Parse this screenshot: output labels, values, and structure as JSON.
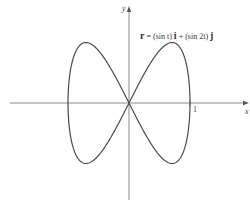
{
  "figure": {
    "equation": {
      "r": "r",
      "eq_part1": " = (sin t) ",
      "i": "i",
      "eq_part2": " + (sin 2t) ",
      "j": "j"
    },
    "axes": {
      "x_label": "x",
      "y_label": "y",
      "x_tick_label": "1"
    },
    "colors": {
      "curve": "#4a4a4a",
      "axis": "#8a8a8a"
    }
  },
  "chart_data": {
    "type": "line",
    "xlabel": "x",
    "ylabel": "y",
    "parametric": {
      "x": "sin t",
      "y": "sin 2t",
      "t_range": [
        0,
        6.2832
      ]
    },
    "xlim": [
      -2,
      2
    ],
    "ylim": [
      -1.7,
      1.7
    ],
    "x_ticks": [
      1
    ],
    "grid": false,
    "key_points": [
      {
        "x": 0,
        "y": 0
      },
      {
        "x": 0.707,
        "y": 1
      },
      {
        "x": 1,
        "y": 0
      },
      {
        "x": 0.707,
        "y": -1
      },
      {
        "x": -0.707,
        "y": 1
      },
      {
        "x": -1,
        "y": 0
      },
      {
        "x": -0.707,
        "y": -1
      }
    ]
  }
}
